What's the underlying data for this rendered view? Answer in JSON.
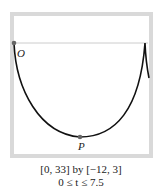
{
  "figure": {
    "point_labels": {
      "origin": "O",
      "bottom": "P"
    },
    "caption": {
      "window": "[0, 33] by [−12, 3]",
      "parameter_range": "0 ≤ t ≤ 7.5"
    },
    "colors": {
      "frame": "#d9d9d9",
      "curve": "#111111",
      "axis_line": "#cccccc",
      "point": "#666666"
    }
  }
}
